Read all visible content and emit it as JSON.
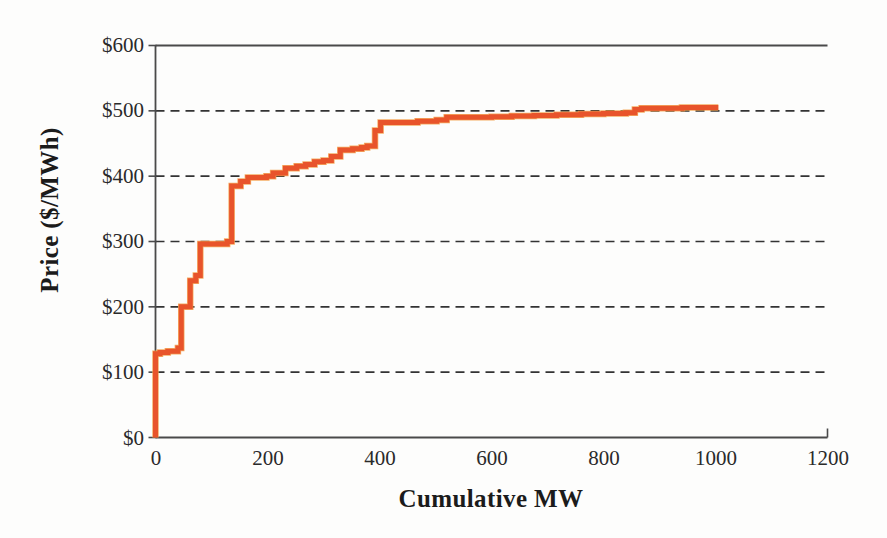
{
  "chart_data": {
    "type": "line",
    "title": "",
    "subtitle": "",
    "xlabel": "Cumulative MW",
    "ylabel": "Price ($/MWh)",
    "xlim": [
      0,
      1200
    ],
    "ylim": [
      0,
      600
    ],
    "xticks": [
      0,
      200,
      400,
      600,
      800,
      1000,
      1200
    ],
    "xtick_labels": [
      "0",
      "200",
      "400",
      "600",
      "800",
      "1000",
      "1200"
    ],
    "yticks": [
      0,
      100,
      200,
      300,
      400,
      500,
      600
    ],
    "ytick_labels": [
      "$0",
      "$100",
      "$200",
      "$300",
      "$400",
      "$500",
      "$600"
    ],
    "grid": {
      "horizontal": true,
      "style": "dashed",
      "color": "#333333",
      "at": [
        100,
        200,
        300,
        400,
        500
      ]
    },
    "legend": null,
    "series": [
      {
        "name": "Supply offer stack",
        "style": "step-post",
        "color": "#E8542B",
        "line_width": 5,
        "x": [
          0,
          0,
          8,
          8,
          22,
          22,
          40,
          40,
          46,
          46,
          62,
          62,
          72,
          72,
          80,
          80,
          128,
          128,
          136,
          136,
          152,
          152,
          165,
          165,
          198,
          198,
          210,
          210,
          232,
          232,
          252,
          252,
          268,
          268,
          284,
          284,
          300,
          300,
          314,
          314,
          330,
          330,
          352,
          352,
          368,
          368,
          378,
          378,
          392,
          392,
          402,
          402,
          468,
          468,
          502,
          502,
          520,
          520,
          560,
          560,
          600,
          600,
          636,
          636,
          676,
          676,
          716,
          716,
          760,
          760,
          800,
          800,
          840,
          840,
          856,
          856,
          868,
          868,
          900,
          900,
          940,
          940,
          1005
        ],
        "y": [
          0,
          128,
          128,
          130,
          130,
          132,
          132,
          137,
          137,
          200,
          200,
          240,
          240,
          248,
          248,
          296,
          296,
          300,
          300,
          385,
          385,
          392,
          392,
          398,
          398,
          400,
          400,
          405,
          405,
          412,
          412,
          415,
          415,
          418,
          418,
          422,
          422,
          424,
          424,
          430,
          430,
          440,
          440,
          442,
          442,
          444,
          444,
          446,
          446,
          470,
          470,
          482,
          482,
          484,
          484,
          486,
          486,
          490,
          490,
          490,
          490,
          491,
          491,
          492,
          492,
          493,
          493,
          494,
          494,
          495,
          495,
          496,
          496,
          497,
          497,
          502,
          502,
          504,
          504,
          504,
          504,
          505,
          505
        ]
      }
    ],
    "annotations": []
  },
  "axis": {
    "y_title": "Price ($/MWh)",
    "x_title": "Cumulative MW",
    "y_tick_labels": [
      "$0",
      "$100",
      "$200",
      "$300",
      "$400",
      "$500",
      "$600"
    ],
    "x_tick_labels": [
      "0",
      "200",
      "400",
      "600",
      "800",
      "1000",
      "1200"
    ]
  },
  "colors": {
    "curve": "#E8542B",
    "curve_highlight": "#F5A04A",
    "axis": "#4a4a4a",
    "grid": "#333333",
    "text": "#1b1b1b",
    "background": "#fdfdfc"
  }
}
